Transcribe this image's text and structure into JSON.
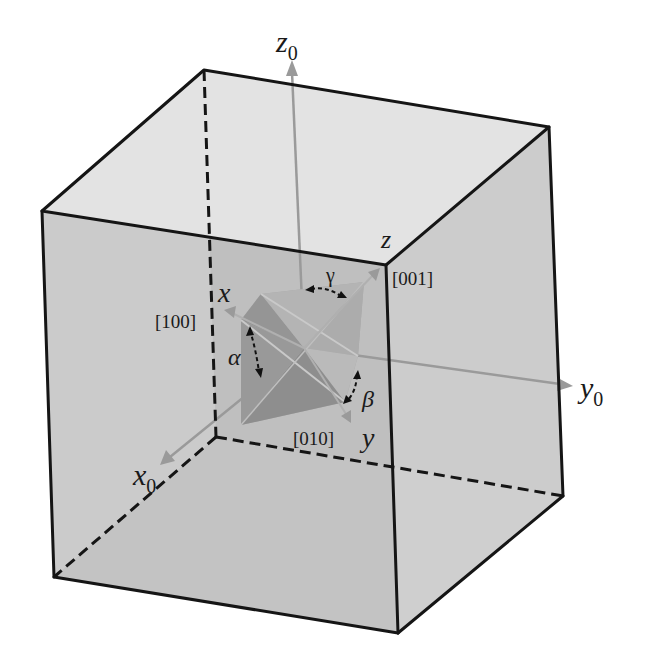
{
  "figure": {
    "colors": {
      "background": "#ffffff",
      "edge": "#151515",
      "face_top": "#e2e2e2",
      "face_right": "#cbcbcb",
      "face_front": "#b9b9b9",
      "face_bottom": "#d9d9d9",
      "face_back_left": "#c4c4c4",
      "axis_arrow": "#9a9a9a",
      "crystal_dark": "#8f8f8f",
      "crystal_mid": "#a3a3a3",
      "crystal_light": "#b3b3b3"
    }
  },
  "sample_axes": {
    "x0": {
      "base": "x",
      "subscript": "0"
    },
    "y0": {
      "base": "y",
      "subscript": "0"
    },
    "z0": {
      "base": "z",
      "subscript": "0"
    }
  },
  "crystal_axes": {
    "x": {
      "label": "x",
      "miller": "[100]"
    },
    "y": {
      "label": "y",
      "miller": "[010]"
    },
    "z": {
      "label": "z",
      "miller": "[001]"
    }
  },
  "angles": {
    "alpha": "α",
    "beta": "β",
    "gamma": "γ"
  }
}
